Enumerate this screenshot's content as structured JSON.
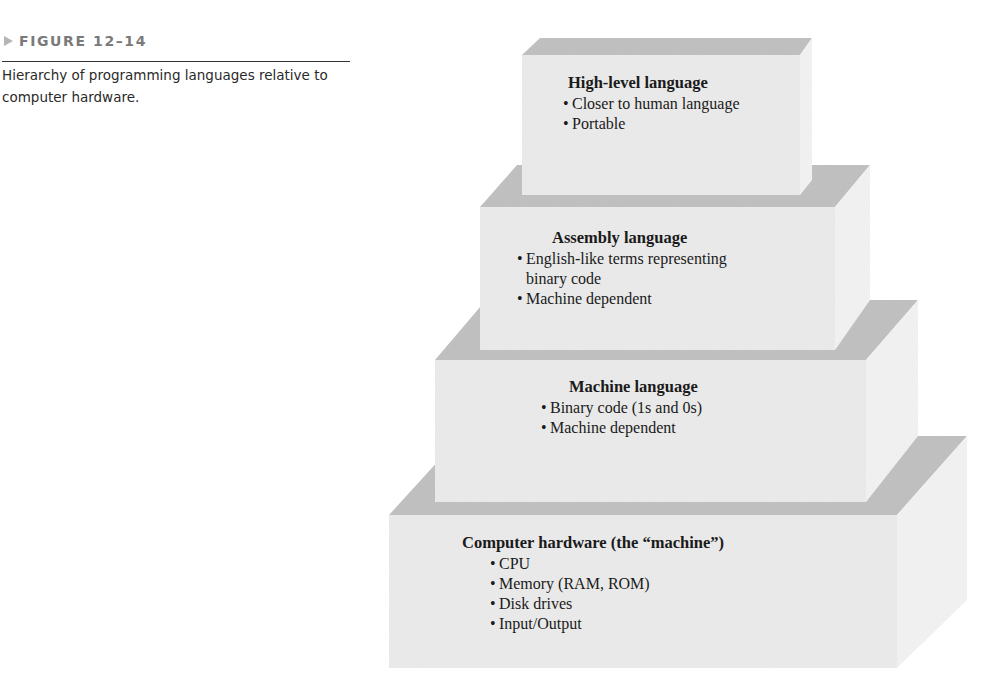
{
  "figure": {
    "label": "FIGURE 12–14",
    "caption": "Hierarchy of programming languages relative to computer hardware."
  },
  "colors": {
    "front_face": "#ececec",
    "top_face": "#bdbdbd",
    "side_face": "#f4f4f4",
    "label_gray": "#7a7a7a",
    "text": "#1a1a1a"
  },
  "tiers": [
    {
      "title": "High-level language",
      "items": [
        "Closer to human language",
        "Portable"
      ]
    },
    {
      "title": "Assembly language",
      "items": [
        "English-like terms representing",
        "binary code",
        "Machine dependent"
      ]
    },
    {
      "title": "Machine language",
      "items": [
        "Binary code (1s and 0s)",
        "Machine dependent"
      ]
    },
    {
      "title": "Computer hardware (the “machine”)",
      "items": [
        "CPU",
        "Memory (RAM, ROM)",
        "Disk drives",
        "Input/Output"
      ]
    }
  ],
  "bullet": "•"
}
